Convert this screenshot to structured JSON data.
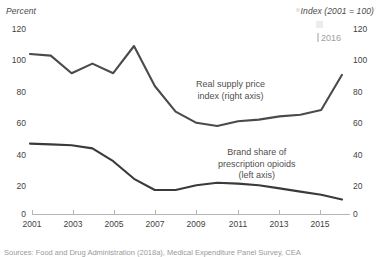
{
  "figure": {
    "source_note": "Sources: Food and Drug Administration (2018a), Medical Expenditure Panel Survey, CEA",
    "watermark_label": "2016"
  },
  "chart_data": {
    "type": "line",
    "title": "",
    "xlabel": "",
    "ylabel": "Percent",
    "y2label": "Index (2001 = 100)",
    "ylim": [
      0,
      120
    ],
    "y2lim": [
      0,
      120
    ],
    "xlim": [
      2001,
      2016
    ],
    "grid": false,
    "legend_position": "inline-annotations",
    "yticks": [
      0,
      20,
      40,
      60,
      80,
      100,
      120
    ],
    "y2ticks": [
      0,
      20,
      40,
      60,
      80,
      100,
      120
    ],
    "ytick_labels": [
      "0",
      "20",
      "40",
      "60",
      "80",
      "100",
      "120"
    ],
    "y2tick_labels": [
      "0",
      "20",
      "40",
      "60",
      "80",
      "100",
      "120"
    ],
    "xticks": [
      2001,
      2003,
      2005,
      2007,
      2009,
      2011,
      2013,
      2015
    ],
    "xtick_labels": [
      "2001",
      "2003",
      "2005",
      "2007",
      "2009",
      "2011",
      "2013",
      "2015"
    ],
    "line_color": "#4a4a4a",
    "x": [
      2001,
      2002,
      2003,
      2004,
      2005,
      2006,
      2007,
      2008,
      2009,
      2010,
      2011,
      2012,
      2013,
      2014,
      2015,
      2016
    ],
    "series": [
      {
        "name": "Real supply price index (right axis)",
        "axis": "right",
        "annotation": "Real supply price index (right axis)",
        "values": [
          100,
          99,
          88,
          94,
          88,
          105,
          80,
          64,
          57,
          55,
          58,
          59,
          61,
          62,
          65,
          87
        ]
      },
      {
        "name": "Brand share of prescription opioids (left axis)",
        "axis": "left",
        "annotation": "Brand share of prescription opioids (left axis)",
        "values": [
          44,
          43.5,
          43,
          41,
          33,
          22,
          15,
          15,
          18,
          19.5,
          19,
          18,
          16,
          14,
          12,
          9
        ]
      }
    ],
    "annotations": [
      {
        "text_line1": "Real supply price",
        "text_line2": "index (right axis)"
      },
      {
        "text_line1": "Brand share of",
        "text_line2": "prescription opioids",
        "text_line3": "(left axis)"
      }
    ]
  }
}
